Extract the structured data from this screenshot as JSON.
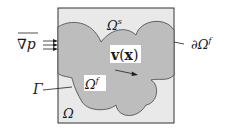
{
  "diagram": {
    "colors": {
      "design_domain_fill": "#e9e9e9",
      "fluid_domain_fill": "#bdbdbd",
      "stroke": "#333333",
      "text": "#1a1a1a"
    },
    "labels": {
      "solid_domain": "Ω",
      "solid_domain_sup": "s",
      "fluid_domain": "Ω",
      "fluid_domain_sup": "f",
      "design_domain": "Ω",
      "interface": "Γ",
      "fluid_boundary_prefix": "∂Ω",
      "fluid_boundary_sup": "f",
      "pressure_gradient": "∇p",
      "velocity_bold": "v",
      "velocity_arg_open": "(",
      "velocity_arg": "x",
      "velocity_arg_close": ")"
    },
    "pressure_arrow_count": 3
  }
}
